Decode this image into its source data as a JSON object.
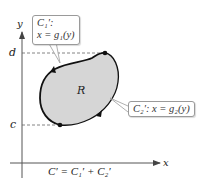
{
  "figure": {
    "axes": {
      "x_label": "x",
      "y_label": "y"
    },
    "y_ticks": [
      {
        "label": "d"
      },
      {
        "label": "c"
      }
    ],
    "region_label": "R",
    "callouts": {
      "c1": {
        "line1": "C₁′:",
        "line2": "x = g₁(y)"
      },
      "c2": {
        "text": "C₂′: x = g₂(y)"
      }
    },
    "caption": "C′ = C₁′ + C₂′",
    "colors": {
      "region_fill": "#d6d6d6",
      "curve": "#111111",
      "dashed": "#666666"
    }
  }
}
